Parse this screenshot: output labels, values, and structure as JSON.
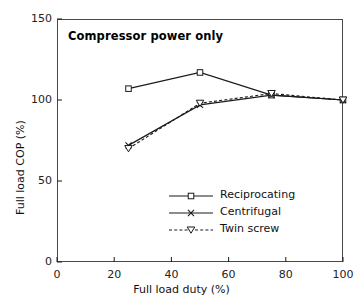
{
  "chart_data": {
    "type": "line",
    "title": "Compressor power only",
    "xlabel": "Full load duty (%)",
    "ylabel": "Full load COP (%)",
    "xlim": [
      0,
      100
    ],
    "ylim": [
      0,
      150
    ],
    "xticks": [
      0,
      20,
      40,
      60,
      80,
      100
    ],
    "yticks": [
      0,
      50,
      100,
      150
    ],
    "grid": false,
    "legend_position": "lower-right-inside",
    "x": [
      25,
      50,
      75,
      100
    ],
    "series": [
      {
        "name": "Reciprocating",
        "marker": "square-open",
        "linestyle": "solid",
        "color": "#1a1a1a",
        "x": [
          25,
          50,
          75,
          100
        ],
        "values": [
          107,
          117,
          103,
          100
        ]
      },
      {
        "name": "Centrifugal",
        "marker": "x-cross",
        "linestyle": "solid",
        "color": "#1a1a1a",
        "x": [
          25,
          50,
          75,
          100
        ],
        "values": [
          72,
          97,
          103,
          100
        ]
      },
      {
        "name": "Twin screw",
        "marker": "triangle-down-open",
        "linestyle": "dashed",
        "color": "#1a1a1a",
        "x": [
          25,
          50,
          75,
          100
        ],
        "values": [
          70,
          98,
          104,
          100
        ]
      }
    ]
  },
  "axes": {
    "x_tick_labels": [
      "0",
      "20",
      "40",
      "60",
      "80",
      "100"
    ],
    "y_tick_labels": [
      "0",
      "50",
      "100",
      "150"
    ],
    "x_title": "Full load duty (%)",
    "y_title": "Full load COP (%)"
  },
  "legend": {
    "items": [
      {
        "label": "Reciprocating",
        "marker": "square-open",
        "linestyle": "solid"
      },
      {
        "label": "Centrifugal",
        "marker": "x-cross",
        "linestyle": "solid"
      },
      {
        "label": "Twin screw",
        "marker": "triangle-down-open",
        "linestyle": "dashed"
      }
    ]
  },
  "annotations": {
    "title_text": "Compressor power only"
  },
  "colors": {
    "ink": "#1a1a1a",
    "frame": "#4a4a4a",
    "background": "#ffffff"
  }
}
